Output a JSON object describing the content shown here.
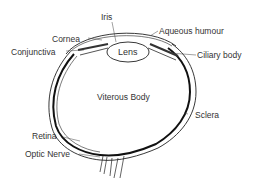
{
  "diagram": {
    "labels": {
      "iris": "Iris",
      "cornea": "Cornea",
      "conjunctiva": "Conjunctiva",
      "aqueous_humour": "Aqueous humour",
      "lens": "Lens",
      "ciliary_body": "Ciliary body",
      "viterous_body": "Viterous Body",
      "sclera": "Sclera",
      "retina": "Retina",
      "optic_nerve": "Optic Nerve"
    },
    "colors": {
      "line": "#222222",
      "text": "#333333",
      "background": "#ffffff"
    }
  }
}
